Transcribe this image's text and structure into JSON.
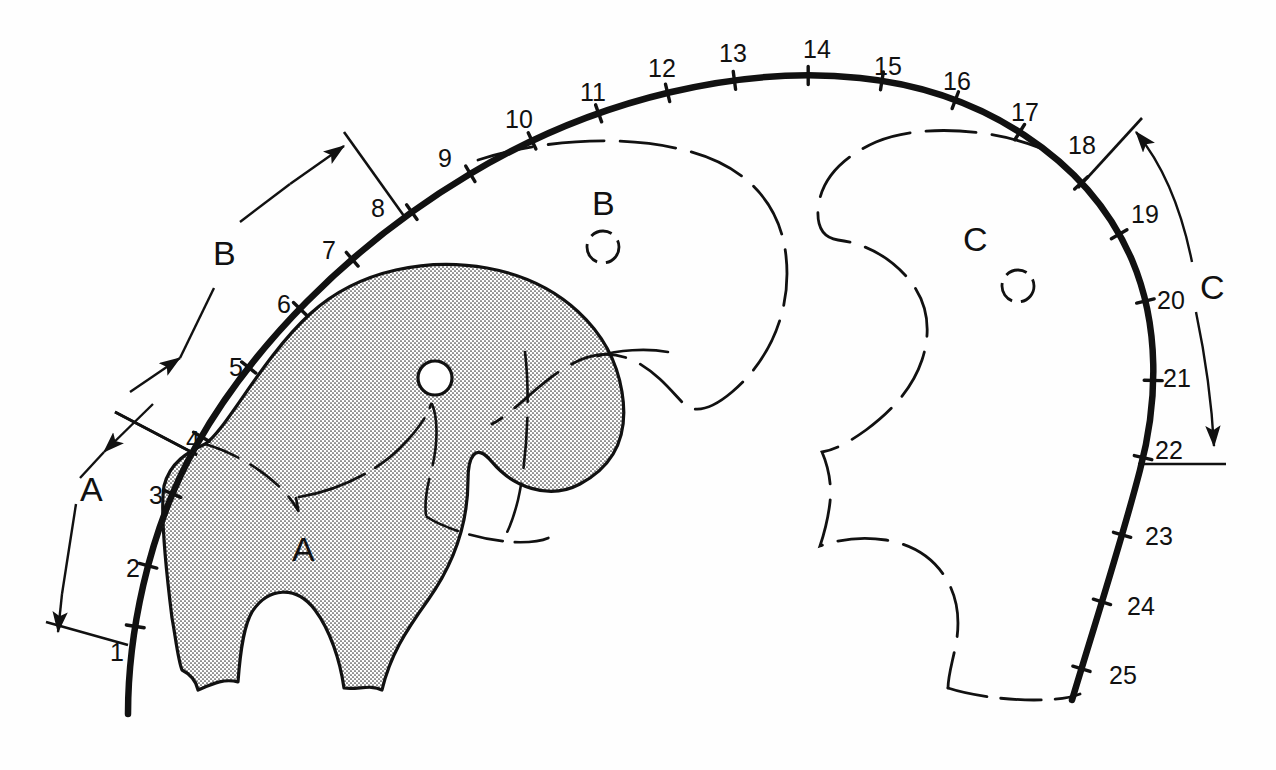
{
  "figure": {
    "background_color": "#fefefe",
    "ink_color": "#111111",
    "stipple_fill_color": "#e8e8e8",
    "width": 1276,
    "height": 770
  },
  "chart_data": {
    "type": "diagram",
    "title": "",
    "station_ticks": [
      {
        "n": "1",
        "x": 139,
        "y": 626,
        "label_x": 110,
        "label_y": 640
      },
      {
        "n": "2",
        "x": 152,
        "y": 566,
        "label_x": 126,
        "label_y": 556
      },
      {
        "n": "3",
        "x": 175,
        "y": 494,
        "label_x": 149,
        "label_y": 483
      },
      {
        "n": "4",
        "x": 208,
        "y": 440,
        "label_x": 186,
        "label_y": 428
      },
      {
        "n": "5",
        "x": 255,
        "y": 373,
        "label_x": 229,
        "label_y": 355
      },
      {
        "n": "6",
        "x": 302,
        "y": 311,
        "label_x": 277,
        "label_y": 292
      },
      {
        "n": "7",
        "x": 351,
        "y": 259,
        "label_x": 322,
        "label_y": 238
      },
      {
        "n": "8",
        "x": 410,
        "y": 209,
        "label_x": 371,
        "label_y": 196
      },
      {
        "n": "9",
        "x": 470,
        "y": 172,
        "label_x": 438,
        "label_y": 146
      },
      {
        "n": "10",
        "x": 528,
        "y": 133,
        "label_x": 505,
        "label_y": 107
      },
      {
        "n": "11",
        "x": 597,
        "y": 109,
        "label_x": 580,
        "label_y": 80
      },
      {
        "n": "12",
        "x": 666,
        "y": 88,
        "label_x": 648,
        "label_y": 56
      },
      {
        "n": "13",
        "x": 733,
        "y": 73,
        "label_x": 719,
        "label_y": 41
      },
      {
        "n": "14",
        "x": 808,
        "y": 70,
        "label_x": 803,
        "label_y": 37
      },
      {
        "n": "15",
        "x": 882,
        "y": 82,
        "label_x": 874,
        "label_y": 54
      },
      {
        "n": "16",
        "x": 954,
        "y": 103,
        "label_x": 943,
        "label_y": 69
      },
      {
        "n": "17",
        "x": 1019,
        "y": 134,
        "label_x": 1011,
        "label_y": 100
      },
      {
        "n": "18",
        "x": 1084,
        "y": 180,
        "label_x": 1068,
        "label_y": 133
      },
      {
        "n": "19",
        "x": 1122,
        "y": 232,
        "label_x": 1131,
        "label_y": 202
      },
      {
        "n": "20",
        "x": 1146,
        "y": 301,
        "label_x": 1157,
        "label_y": 288
      },
      {
        "n": "21",
        "x": 1152,
        "y": 381,
        "label_x": 1163,
        "label_y": 366
      },
      {
        "n": "22",
        "x": 1143,
        "y": 458,
        "label_x": 1155,
        "label_y": 438
      },
      {
        "n": "23",
        "x": 1131,
        "y": 537,
        "label_x": 1145,
        "label_y": 524
      },
      {
        "n": "24",
        "x": 1112,
        "y": 604,
        "label_x": 1127,
        "label_y": 594
      },
      {
        "n": "25",
        "x": 1093,
        "y": 672,
        "label_x": 1109,
        "label_y": 663
      }
    ],
    "dimension_spans": [
      {
        "id": "A",
        "label": "A",
        "from_tick": "1",
        "to_tick": "4",
        "label_x": 80,
        "label_y": 472
      },
      {
        "id": "B",
        "label": "B",
        "from_tick": "4",
        "to_tick": "8",
        "label_x": 213,
        "label_y": 236
      },
      {
        "id": "C",
        "label": "C",
        "from_tick": "18",
        "to_tick": "22",
        "label_x": 1200,
        "label_y": 288
      }
    ],
    "regions": [
      {
        "id": "A",
        "label": "A",
        "style": "solid-outline-stippled-fill",
        "label_x": 298,
        "label_y": 538,
        "hole": {
          "x": 435,
          "y": 378,
          "r": 17,
          "style": "solid"
        }
      },
      {
        "id": "B",
        "label": "B",
        "style": "dashed-outline",
        "label_x": 600,
        "label_y": 198,
        "hole": {
          "x": 603,
          "y": 247,
          "r": 16,
          "style": "dashed"
        }
      },
      {
        "id": "C",
        "label": "C",
        "style": "dashed-outline",
        "label_x": 972,
        "label_y": 234,
        "hole": {
          "x": 1018,
          "y": 286,
          "r": 16,
          "style": "dashed"
        }
      }
    ]
  },
  "labels": {
    "tick_1": "1",
    "tick_2": "2",
    "tick_3": "3",
    "tick_4": "4",
    "tick_5": "5",
    "tick_6": "6",
    "tick_7": "7",
    "tick_8": "8",
    "tick_9": "9",
    "tick_10": "10",
    "tick_11": "11",
    "tick_12": "12",
    "tick_13": "13",
    "tick_14": "14",
    "tick_15": "15",
    "tick_16": "16",
    "tick_17": "17",
    "tick_18": "18",
    "tick_19": "19",
    "tick_20": "20",
    "tick_21": "21",
    "tick_22": "22",
    "tick_23": "23",
    "tick_24": "24",
    "tick_25": "25",
    "dim_a": "A",
    "dim_b": "B",
    "dim_c": "C",
    "region_a": "A",
    "region_b": "B",
    "region_c": "C"
  }
}
